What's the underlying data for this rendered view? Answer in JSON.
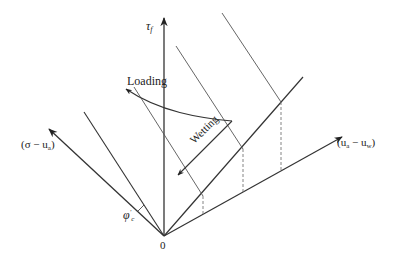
{
  "diagram": {
    "type": "extended Mohr-Coulomb failure envelope (unsaturated soil, loading and wetting paths)",
    "axes": {
      "vertical": {
        "symbol": "τ",
        "subscript": "f"
      },
      "left": {
        "text_open": "(σ − u",
        "subscript": "a",
        "text_close": ")"
      },
      "right": {
        "text_open": "(u",
        "sub1": "a",
        "middle": " − u",
        "sub2": "w",
        "text_close": ")"
      },
      "origin": "0"
    },
    "labels": {
      "loading": "Loading",
      "wetting": "Wetting",
      "phi": {
        "symbol": "φ",
        "prime": "′",
        "subscript": "c"
      }
    },
    "colors": {
      "line": "#333333",
      "dashed": "#777777",
      "background": "#ffffff"
    }
  }
}
